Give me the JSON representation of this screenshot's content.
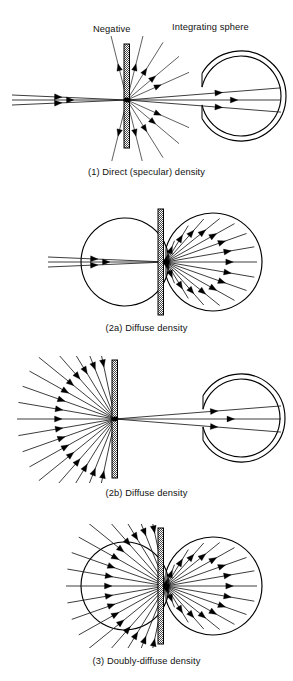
{
  "figure": {
    "width": 293,
    "height": 681,
    "background": "#ffffff",
    "ink_color": "#000000",
    "ray_color": "#1a1a1a",
    "plate_fill": "#d9d9d9"
  },
  "labels": {
    "negative": "Negative",
    "integrating_sphere": "Integrating sphere"
  },
  "panels": [
    {
      "id": "panel-1",
      "caption": "(1) Direct (specular) density",
      "caption_y": 166,
      "top": 36,
      "svg_height": 125,
      "plate": {
        "x": 124,
        "y": 8,
        "w": 5.5,
        "h": 104,
        "label": "negative"
      },
      "node": {
        "x": 127,
        "y": 64
      },
      "sphere": {
        "cx": 241,
        "cy": 60,
        "r_inner": 40,
        "r_outer": 45,
        "port_x": 202
      },
      "incoming": {
        "type": "collimated",
        "count": 3,
        "x_start": 12,
        "offsets": [
          -5,
          0,
          5
        ],
        "arrow_x": [
          62,
          74,
          62
        ]
      },
      "transmitted": {
        "type": "narrow-cone",
        "count": 3,
        "half_angle_deg": 4.5,
        "reach_x": 281,
        "arrow_frac": [
          0.62,
          0.72,
          0.62
        ]
      },
      "scattered": {
        "type": "weak-fan",
        "count": 10,
        "length": 68,
        "arrow_frac": 0.55,
        "angles_deg": [
          -76,
          -58,
          -40,
          -24,
          24,
          40,
          58,
          76,
          104,
          256
        ]
      }
    },
    {
      "id": "panel-2a",
      "caption": "(2a) Diffuse density",
      "caption_y": 322,
      "top": 205,
      "svg_height": 115,
      "plate": {
        "x": 158,
        "y": 4,
        "w": 5.5,
        "h": 106,
        "label": "negative"
      },
      "node": {
        "x": 166,
        "y": 57
      },
      "sphere": {
        "cx": 213,
        "cy": 57,
        "r_inner": 44,
        "r_outer": 49,
        "port_x": 166
      },
      "incoming": {
        "type": "collimated",
        "count": 3,
        "x_start": 48,
        "offsets": [
          -5,
          0,
          5
        ],
        "arrow_x": [
          98,
          110,
          98
        ]
      },
      "transmitted": {
        "type": "wide-fan",
        "count": 17,
        "half_angle_deg": 78,
        "arrow_frac": 0.74
      },
      "scattered": {
        "type": "none",
        "count": 0
      }
    },
    {
      "id": "panel-2b",
      "caption": "(2b) Diffuse density",
      "caption_y": 487,
      "top": 356,
      "svg_height": 127,
      "plate": {
        "x": 112,
        "y": 4,
        "w": 5.5,
        "h": 118,
        "label": "negative"
      },
      "node": {
        "x": 115,
        "y": 63
      },
      "sphere": {
        "cx": 241,
        "cy": 62,
        "r_inner": 39,
        "r_outer": 44,
        "port_x": 203
      },
      "incoming": {
        "type": "wide-fan-inbound",
        "count": 17,
        "half_angle_deg": 78,
        "length": 98,
        "arrow_frac": 0.46
      },
      "transmitted": {
        "type": "narrow-cone",
        "count": 3,
        "half_angle_deg": 4.5,
        "reach_x": 281,
        "arrow_frac": [
          0.62,
          0.72,
          0.62
        ]
      },
      "scattered": {
        "type": "none",
        "count": 0
      }
    },
    {
      "id": "panel-3",
      "caption": "(3) Doubly-diffuse density",
      "caption_y": 655,
      "top": 524,
      "svg_height": 124,
      "plate": {
        "x": 158,
        "y": 4,
        "w": 5.5,
        "h": 116,
        "label": "negative"
      },
      "node": {
        "x": 166,
        "y": 62
      },
      "sphere": {
        "cx": 213,
        "cy": 62,
        "r_inner": 44,
        "r_outer": 49,
        "port_x": 166
      },
      "incoming": {
        "type": "wide-fan-inbound",
        "count": 17,
        "half_angle_deg": 78,
        "length": 100,
        "arrow_frac": 0.46
      },
      "transmitted": {
        "type": "wide-fan",
        "count": 17,
        "half_angle_deg": 78,
        "arrow_frac": 0.74
      },
      "scattered": {
        "type": "none",
        "count": 0
      }
    }
  ]
}
